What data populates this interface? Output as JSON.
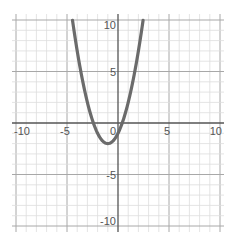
{
  "chart_data": {
    "type": "line",
    "title": "",
    "xlabel": "",
    "ylabel": "",
    "xlim": [
      -10,
      10
    ],
    "ylim": [
      -10,
      10
    ],
    "grid": true,
    "grid_step": 1,
    "x_ticks": [
      -10,
      -5,
      0,
      5,
      10
    ],
    "x_tick_labels": [
      "-10",
      "-5",
      "0",
      "5",
      "10"
    ],
    "y_ticks": [
      -10,
      -5,
      5,
      10
    ],
    "y_tick_labels": [
      "-10",
      "-5",
      "5",
      "10"
    ],
    "origin_label": "0",
    "series": [
      {
        "name": "y = x^2 + 2x - 1",
        "equation": "y = (x + 1)^2 - 2",
        "vertex": [
          -1,
          -2
        ],
        "x_intercepts": [
          -2.41,
          0.41
        ],
        "y_intercept": -1,
        "x": [
          -4.46,
          -4,
          -3.5,
          -3,
          -2.5,
          -2.41,
          -2,
          -1.5,
          -1,
          -0.5,
          0,
          0.41,
          0.5,
          1,
          1.5,
          2,
          2.46
        ],
        "y": [
          10,
          7,
          4.25,
          2,
          0.25,
          0,
          -1,
          -1.75,
          -2,
          -1.75,
          -1,
          0,
          0.25,
          2,
          4.25,
          7,
          10
        ]
      }
    ],
    "colors": {
      "curve": "#6b6b6b",
      "axis": "#555555",
      "grid_minor": "#dddddd",
      "grid_major": "#a8a8a8",
      "background": "#ffffff"
    }
  }
}
